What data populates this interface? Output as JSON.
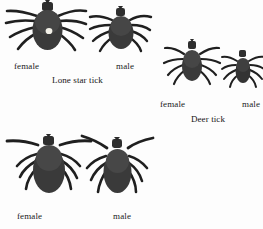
{
  "figure": {
    "background_color": "#fdfdfd",
    "body_color": "#3a3a3a",
    "leg_color": "#1f1f1f",
    "scutum_spot_color": "#f2f0e8",
    "text_color": "#1a1a1a"
  },
  "groups": [
    {
      "id": "lone-star",
      "species_caption": "Lone star tick",
      "specimens": [
        {
          "sex_label": "female",
          "size": "large",
          "marking": "white-dot-on-scutum"
        },
        {
          "sex_label": "male",
          "size": "medium",
          "marking": "none"
        }
      ]
    },
    {
      "id": "deer",
      "species_caption": "Deer tick",
      "specimens": [
        {
          "sex_label": "female",
          "size": "small",
          "marking": "none"
        },
        {
          "sex_label": "male",
          "size": "very-small",
          "marking": "none"
        }
      ]
    },
    {
      "id": "third",
      "species_caption": "",
      "specimens": [
        {
          "sex_label": "female",
          "size": "large",
          "marking": "outstretched-forelegs"
        },
        {
          "sex_label": "male",
          "size": "large",
          "marking": "outstretched-forelegs"
        }
      ]
    }
  ]
}
